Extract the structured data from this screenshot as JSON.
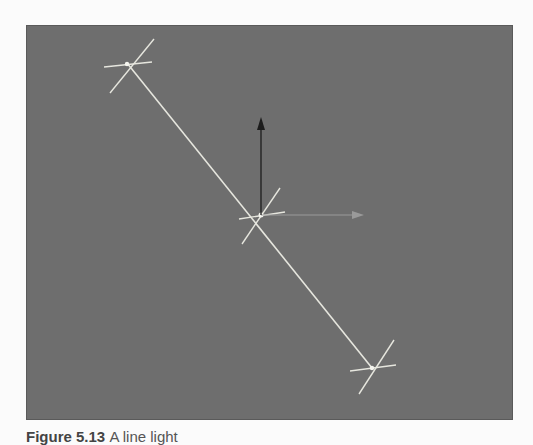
{
  "figure": {
    "caption_prefix": "Figure 5.13",
    "caption_text": "A line light"
  },
  "viewport": {
    "background": "#6e6e6e",
    "line_color": "#e8e8e0",
    "y_axis_color": "#1a1a1a",
    "x_axis_color": "#9a9a9a"
  },
  "scene": {
    "light_line": {
      "start": [
        101,
        38
      ],
      "end": [
        346,
        343
      ]
    },
    "center_pivot": [
      235,
      190
    ],
    "y_axis_gizmo": {
      "from": [
        235,
        190
      ],
      "to": [
        235,
        92
      ]
    },
    "x_axis_gizmo": {
      "from": [
        235,
        190
      ],
      "to": [
        336,
        190
      ]
    }
  }
}
